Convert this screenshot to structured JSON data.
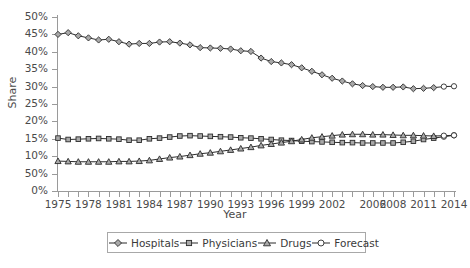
{
  "chart_data": {
    "type": "line",
    "title": "",
    "xlabel": "Year",
    "ylabel": "Share",
    "grid": false,
    "legend_position": "bottom",
    "xlim": [
      1975,
      2014
    ],
    "ylim": [
      0,
      50
    ],
    "ytick_labels": [
      "50%",
      "45%",
      "40%",
      "35%",
      "30%",
      "25%",
      "20%",
      "15%",
      "10%",
      "50%",
      "0%"
    ],
    "ytick_values": [
      50,
      45,
      40,
      35,
      30,
      25,
      20,
      15,
      10,
      5,
      0
    ],
    "xtick_labels": [
      "1975",
      "1978",
      "1981",
      "1984",
      "1987",
      "1990",
      "1993",
      "1996",
      "1999",
      "2002",
      "2006",
      "2008",
      "2011",
      "2014"
    ],
    "xtick_values": [
      1975,
      1978,
      1981,
      1984,
      1987,
      1990,
      1993,
      1996,
      1999,
      2002,
      2006,
      2008,
      2011,
      2014
    ],
    "x": [
      1975,
      1976,
      1977,
      1978,
      1979,
      1980,
      1981,
      1982,
      1983,
      1984,
      1985,
      1986,
      1987,
      1988,
      1989,
      1990,
      1991,
      1992,
      1993,
      1994,
      1995,
      1996,
      1997,
      1998,
      1999,
      2000,
      2001,
      2002,
      2003,
      2004,
      2005,
      2006,
      2007,
      2008,
      2009,
      2010,
      2011,
      2012,
      2013,
      2014
    ],
    "series": [
      {
        "name": "Hospitals",
        "marker": "diamond",
        "values": [
          45.0,
          45.5,
          44.6,
          44.0,
          43.4,
          43.6,
          42.9,
          42.2,
          42.4,
          42.4,
          42.8,
          42.9,
          42.5,
          42.0,
          41.2,
          41.1,
          41.0,
          40.8,
          40.3,
          40.1,
          38.2,
          37.2,
          36.8,
          36.3,
          35.4,
          34.4,
          33.4,
          32.4,
          31.6,
          30.8,
          30.3,
          30.0,
          29.8,
          29.8,
          29.9,
          29.4,
          29.5,
          29.7,
          30.0,
          30.1
        ]
      },
      {
        "name": "Physicians",
        "marker": "square",
        "values": [
          15.2,
          14.8,
          14.9,
          15.0,
          15.1,
          15.0,
          14.9,
          14.6,
          14.6,
          15.0,
          15.2,
          15.5,
          15.8,
          15.9,
          15.8,
          15.7,
          15.6,
          15.5,
          15.3,
          15.2,
          15.0,
          14.8,
          14.6,
          14.5,
          14.3,
          14.2,
          14.1,
          14.0,
          13.9,
          13.9,
          13.8,
          13.8,
          13.8,
          13.8,
          14.0,
          14.3,
          14.8,
          15.2,
          15.6,
          16.0
        ]
      },
      {
        "name": "Drugs",
        "marker": "triangle",
        "values": [
          8.6,
          8.5,
          8.4,
          8.4,
          8.4,
          8.4,
          8.5,
          8.5,
          8.6,
          8.8,
          9.2,
          9.6,
          9.9,
          10.3,
          10.7,
          11.0,
          11.4,
          11.8,
          12.2,
          12.6,
          13.1,
          13.5,
          13.9,
          14.3,
          14.8,
          15.3,
          15.6,
          15.9,
          16.2,
          16.3,
          16.3,
          16.2,
          16.2,
          16.1,
          16.0,
          16.0,
          15.9,
          15.8,
          15.9,
          16.0
        ]
      }
    ],
    "forecast": {
      "name": "Forecast",
      "marker": "circle-open",
      "start_year": 2013,
      "note": "Last two points of each series are drawn as open circles"
    }
  },
  "legend": {
    "items": [
      {
        "label": "Hospitals",
        "marker": "diamond"
      },
      {
        "label": "Physicians",
        "marker": "square"
      },
      {
        "label": "Drugs",
        "marker": "triangle"
      },
      {
        "label": "Forecast",
        "marker": "circle-open"
      }
    ]
  },
  "colors": {
    "line": "#2b2b2b",
    "marker_fill": "#a9a9a9",
    "marker_open": "#ffffff",
    "axis": "#9a9a9a",
    "text": "#3a3a3a"
  }
}
